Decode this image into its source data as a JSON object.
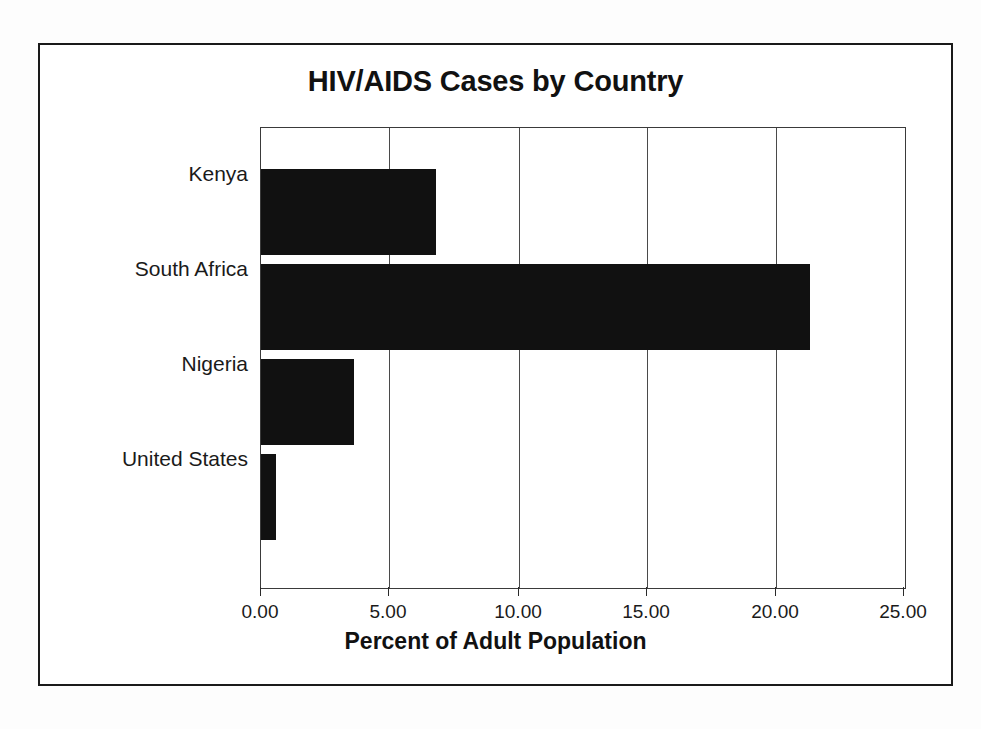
{
  "figure": {
    "title": "HIV/AIDS Cases by Country"
  },
  "chart_data": {
    "type": "bar",
    "orientation": "horizontal",
    "title": "HIV/AIDS Cases by Country",
    "subtitle": "",
    "xlabel": "Percent of Adult Population",
    "ylabel": "",
    "categories": [
      "Kenya",
      "South Africa",
      "Nigeria",
      "United States"
    ],
    "values": [
      6.8,
      21.3,
      3.6,
      0.6
    ],
    "series": [
      {
        "name": "Percent of Adult Population",
        "values": [
          6.8,
          21.3,
          3.6,
          0.6
        ]
      }
    ],
    "xlim": [
      0,
      25
    ],
    "xticks": [
      0,
      5,
      10,
      15,
      20,
      25
    ],
    "xtick_labels": [
      "0.00",
      "5.00",
      "10.00",
      "15.00",
      "20.00",
      "25.00"
    ],
    "grid": "vertical",
    "legend": "none",
    "bar_color": "#111111",
    "annotations": []
  }
}
